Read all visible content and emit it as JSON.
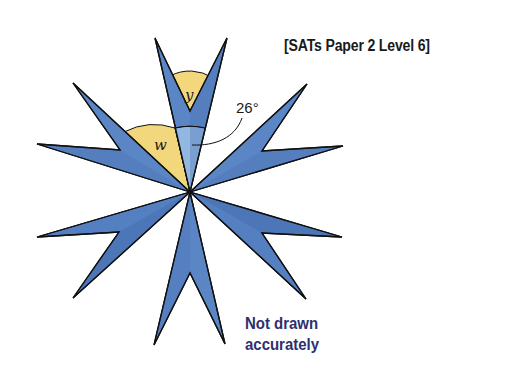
{
  "source_label": "[SATs Paper 2 Level 6]",
  "note": {
    "line1": "Not drawn",
    "line2": "accurately"
  },
  "diagram": {
    "angles": [
      {
        "id": "y",
        "label": "y",
        "description": "angle at notch of top arm"
      },
      {
        "id": "w",
        "label": "w",
        "description": "angle between top arm and upper-left arm at center"
      },
      {
        "id": "tip",
        "label": "26°",
        "description": "angle at center of top arm"
      }
    ]
  },
  "colors": {
    "arm_fill": "#5b86c6",
    "arm_shade": "#4a70b3",
    "angle_fill": "#f2d77c",
    "highlight_fill": "#92b8e2",
    "note_text": "#2e2f6e",
    "outline": "#111111"
  }
}
